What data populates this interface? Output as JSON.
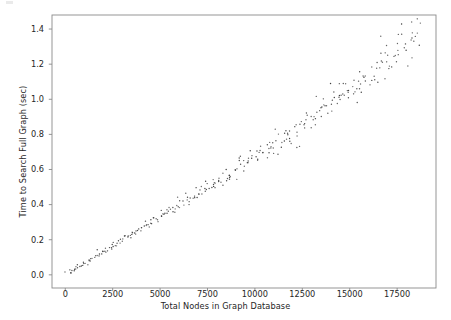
{
  "figure": {
    "background": "#ffffff",
    "axes_frame_color": "#8a8a8a",
    "tick_color": "#8a8a8a",
    "marker_color": "#3a3a3a"
  },
  "chart_data": {
    "type": "scatter",
    "title": "",
    "xlabel": "Total Nodes in Graph Database",
    "ylabel": "Time to Search Full Graph (sec)",
    "xlim": [
      -700,
      19550
    ],
    "ylim": [
      -0.075,
      1.48
    ],
    "xticks": [
      0,
      2500,
      5000,
      7500,
      10000,
      12500,
      15000,
      17500
    ],
    "xtick_labels": [
      "0",
      "2500",
      "5000",
      "7500",
      "10000",
      "12500",
      "15000",
      "17500"
    ],
    "yticks": [
      0.0,
      0.2,
      0.4,
      0.6,
      0.8,
      1.0,
      1.2,
      1.4
    ],
    "ytick_labels": [
      "0.0",
      "0.2",
      "0.4",
      "0.6",
      "0.8",
      "1.0",
      "1.2",
      "1.4"
    ],
    "grid": false,
    "legend": null,
    "marker": "point",
    "marker_size_px": 1.4,
    "n_points": 600,
    "relationship": "near-linear, slightly super-linear growth of search time with node count; scatter band widens as node count increases",
    "approx_slope_sec_per_node": 6.55e-05,
    "x_range_observed": [
      60,
      18700
    ],
    "y_range_observed": [
      0.004,
      1.37
    ],
    "points": [
      [
        120,
        0.006
      ],
      [
        180,
        0.012
      ],
      [
        240,
        0.015
      ],
      [
        300,
        0.018
      ],
      [
        360,
        0.022
      ],
      [
        420,
        0.027
      ],
      [
        480,
        0.03
      ],
      [
        540,
        0.034
      ],
      [
        600,
        0.038
      ],
      [
        660,
        0.043
      ],
      [
        720,
        0.046
      ],
      [
        780,
        0.05
      ],
      [
        840,
        0.055
      ],
      [
        900,
        0.058
      ],
      [
        960,
        0.062
      ],
      [
        1020,
        0.066
      ],
      [
        1080,
        0.071
      ],
      [
        1140,
        0.074
      ],
      [
        1200,
        0.079
      ],
      [
        1260,
        0.082
      ],
      [
        1320,
        0.087
      ],
      [
        1380,
        0.09
      ],
      [
        1440,
        0.095
      ],
      [
        1500,
        0.098
      ],
      [
        1560,
        0.102
      ],
      [
        1620,
        0.107
      ],
      [
        1680,
        0.11
      ],
      [
        1740,
        0.115
      ],
      [
        1800,
        0.118
      ],
      [
        1860,
        0.122
      ],
      [
        1920,
        0.127
      ],
      [
        1980,
        0.13
      ],
      [
        2040,
        0.134
      ],
      [
        2100,
        0.139
      ],
      [
        2160,
        0.142
      ],
      [
        2220,
        0.146
      ],
      [
        2280,
        0.151
      ],
      [
        2340,
        0.154
      ],
      [
        2400,
        0.158
      ],
      [
        2460,
        0.163
      ],
      [
        2520,
        0.166
      ],
      [
        2580,
        0.17
      ],
      [
        2640,
        0.175
      ],
      [
        2700,
        0.178
      ],
      [
        2760,
        0.183
      ],
      [
        2820,
        0.186
      ],
      [
        2880,
        0.19
      ],
      [
        2940,
        0.195
      ],
      [
        3000,
        0.198
      ],
      [
        3060,
        0.202
      ],
      [
        3120,
        0.207
      ],
      [
        3180,
        0.21
      ],
      [
        3240,
        0.214
      ],
      [
        3300,
        0.219
      ],
      [
        3360,
        0.222
      ],
      [
        3420,
        0.226
      ],
      [
        3480,
        0.231
      ],
      [
        3540,
        0.234
      ],
      [
        3600,
        0.238
      ],
      [
        3660,
        0.243
      ],
      [
        3720,
        0.246
      ],
      [
        3780,
        0.251
      ],
      [
        3840,
        0.254
      ],
      [
        3900,
        0.258
      ],
      [
        3960,
        0.263
      ],
      [
        4020,
        0.266
      ],
      [
        4080,
        0.27
      ],
      [
        4140,
        0.275
      ],
      [
        4200,
        0.278
      ],
      [
        4260,
        0.283
      ],
      [
        4320,
        0.286
      ],
      [
        4380,
        0.29
      ],
      [
        4440,
        0.295
      ],
      [
        4500,
        0.298
      ],
      [
        4560,
        0.302
      ],
      [
        4620,
        0.307
      ],
      [
        4680,
        0.31
      ],
      [
        4740,
        0.315
      ],
      [
        4800,
        0.318
      ],
      [
        4860,
        0.323
      ],
      [
        4920,
        0.326
      ],
      [
        4980,
        0.33
      ],
      [
        5040,
        0.335
      ],
      [
        5100,
        0.338
      ],
      [
        5160,
        0.343
      ],
      [
        5220,
        0.346
      ],
      [
        5280,
        0.35
      ],
      [
        5340,
        0.355
      ],
      [
        5400,
        0.358
      ],
      [
        5460,
        0.363
      ],
      [
        5520,
        0.366
      ],
      [
        5580,
        0.371
      ],
      [
        5640,
        0.374
      ],
      [
        5700,
        0.378
      ],
      [
        5760,
        0.383
      ],
      [
        5820,
        0.386
      ],
      [
        5880,
        0.391
      ],
      [
        5940,
        0.394
      ],
      [
        6000,
        0.399
      ],
      [
        6060,
        0.402
      ],
      [
        6120,
        0.407
      ],
      [
        6180,
        0.41
      ],
      [
        6240,
        0.415
      ],
      [
        6300,
        0.418
      ],
      [
        6360,
        0.423
      ],
      [
        6420,
        0.426
      ],
      [
        6480,
        0.431
      ],
      [
        6540,
        0.434
      ],
      [
        6600,
        0.439
      ],
      [
        6660,
        0.442
      ],
      [
        6720,
        0.447
      ],
      [
        6780,
        0.45
      ],
      [
        6840,
        0.455
      ],
      [
        6900,
        0.458
      ],
      [
        6960,
        0.463
      ],
      [
        7020,
        0.466
      ],
      [
        7080,
        0.471
      ],
      [
        7140,
        0.474
      ],
      [
        7200,
        0.479
      ],
      [
        7260,
        0.482
      ],
      [
        7320,
        0.487
      ],
      [
        7380,
        0.49
      ],
      [
        7440,
        0.495
      ],
      [
        7500,
        0.498
      ],
      [
        7560,
        0.503
      ],
      [
        7620,
        0.506
      ],
      [
        7680,
        0.511
      ],
      [
        7740,
        0.515
      ],
      [
        7800,
        0.519
      ],
      [
        7860,
        0.523
      ],
      [
        7920,
        0.527
      ],
      [
        7980,
        0.531
      ],
      [
        8040,
        0.535
      ],
      [
        8100,
        0.539
      ],
      [
        8160,
        0.543
      ],
      [
        8220,
        0.547
      ],
      [
        8280,
        0.551
      ],
      [
        8340,
        0.555
      ],
      [
        8400,
        0.559
      ],
      [
        8460,
        0.563
      ],
      [
        8520,
        0.567
      ],
      [
        8580,
        0.571
      ],
      [
        8640,
        0.575
      ],
      [
        8700,
        0.579
      ],
      [
        8760,
        0.583
      ],
      [
        8820,
        0.588
      ],
      [
        8880,
        0.592
      ],
      [
        8940,
        0.596
      ],
      [
        9000,
        0.6
      ],
      [
        9060,
        0.604
      ],
      [
        9120,
        0.608
      ],
      [
        9180,
        0.612
      ],
      [
        9240,
        0.616
      ],
      [
        9300,
        0.62
      ],
      [
        9360,
        0.625
      ],
      [
        9420,
        0.629
      ],
      [
        9480,
        0.633
      ],
      [
        9540,
        0.637
      ],
      [
        9600,
        0.641
      ],
      [
        9660,
        0.645
      ],
      [
        9720,
        0.65
      ],
      [
        9780,
        0.654
      ],
      [
        9840,
        0.658
      ],
      [
        9900,
        0.662
      ],
      [
        9960,
        0.666
      ],
      [
        10020,
        0.671
      ],
      [
        10080,
        0.675
      ],
      [
        10140,
        0.679
      ],
      [
        10200,
        0.683
      ],
      [
        10260,
        0.688
      ],
      [
        10320,
        0.692
      ],
      [
        10380,
        0.696
      ],
      [
        10440,
        0.7
      ],
      [
        10500,
        0.705
      ],
      [
        10560,
        0.709
      ],
      [
        10620,
        0.713
      ],
      [
        10680,
        0.718
      ],
      [
        10740,
        0.722
      ],
      [
        10800,
        0.726
      ],
      [
        10860,
        0.731
      ],
      [
        10920,
        0.735
      ],
      [
        10980,
        0.739
      ],
      [
        11040,
        0.744
      ],
      [
        11100,
        0.748
      ],
      [
        11160,
        0.752
      ],
      [
        11220,
        0.757
      ],
      [
        11280,
        0.761
      ],
      [
        11340,
        0.766
      ],
      [
        11400,
        0.77
      ],
      [
        11460,
        0.774
      ],
      [
        11520,
        0.779
      ],
      [
        11580,
        0.783
      ],
      [
        11640,
        0.788
      ],
      [
        11700,
        0.792
      ],
      [
        11760,
        0.797
      ],
      [
        11820,
        0.801
      ],
      [
        11880,
        0.806
      ],
      [
        11940,
        0.81
      ],
      [
        12000,
        0.815
      ],
      [
        12060,
        0.819
      ],
      [
        12120,
        0.824
      ],
      [
        12180,
        0.828
      ],
      [
        12240,
        0.833
      ],
      [
        12300,
        0.837
      ],
      [
        12360,
        0.842
      ],
      [
        12420,
        0.846
      ],
      [
        12480,
        0.851
      ],
      [
        12540,
        0.855
      ],
      [
        12600,
        0.86
      ],
      [
        12660,
        0.865
      ],
      [
        12720,
        0.869
      ],
      [
        12780,
        0.874
      ],
      [
        12840,
        0.878
      ],
      [
        12900,
        0.883
      ],
      [
        12960,
        0.888
      ],
      [
        13020,
        0.892
      ],
      [
        13080,
        0.897
      ],
      [
        13140,
        0.902
      ],
      [
        13200,
        0.906
      ],
      [
        13260,
        0.911
      ],
      [
        13320,
        0.916
      ],
      [
        13380,
        0.92
      ],
      [
        13440,
        0.925
      ],
      [
        13500,
        0.93
      ],
      [
        13560,
        0.934
      ],
      [
        13620,
        0.939
      ],
      [
        13680,
        0.944
      ],
      [
        13740,
        0.949
      ],
      [
        13800,
        0.953
      ],
      [
        13860,
        0.958
      ],
      [
        13920,
        0.963
      ],
      [
        13980,
        0.968
      ],
      [
        14040,
        0.972
      ],
      [
        14100,
        0.977
      ],
      [
        14160,
        0.982
      ],
      [
        14220,
        0.987
      ],
      [
        14280,
        0.992
      ],
      [
        14340,
        0.996
      ],
      [
        14400,
        1.001
      ],
      [
        14460,
        1.006
      ],
      [
        14520,
        1.011
      ],
      [
        14580,
        1.016
      ],
      [
        14640,
        1.021
      ],
      [
        14700,
        1.026
      ],
      [
        14760,
        1.03
      ],
      [
        14820,
        1.035
      ],
      [
        14880,
        1.04
      ],
      [
        14940,
        1.045
      ],
      [
        15000,
        1.05
      ],
      [
        15060,
        1.055
      ],
      [
        15120,
        1.06
      ],
      [
        15180,
        1.065
      ],
      [
        15240,
        1.07
      ],
      [
        15300,
        1.075
      ],
      [
        15360,
        1.08
      ],
      [
        15420,
        1.085
      ],
      [
        15480,
        1.09
      ],
      [
        15540,
        1.095
      ],
      [
        15600,
        1.1
      ],
      [
        15660,
        1.105
      ],
      [
        15720,
        1.11
      ],
      [
        15780,
        1.115
      ],
      [
        15840,
        1.12
      ],
      [
        15900,
        1.125
      ],
      [
        15960,
        1.13
      ],
      [
        16020,
        1.135
      ],
      [
        16080,
        1.14
      ],
      [
        16140,
        1.145
      ],
      [
        16200,
        1.151
      ],
      [
        16260,
        1.156
      ],
      [
        16320,
        1.161
      ],
      [
        16380,
        1.166
      ],
      [
        16440,
        1.171
      ],
      [
        16500,
        1.176
      ],
      [
        16560,
        1.182
      ],
      [
        16620,
        1.187
      ],
      [
        16680,
        1.192
      ],
      [
        16740,
        1.197
      ],
      [
        16800,
        1.203
      ],
      [
        16860,
        1.208
      ],
      [
        16920,
        1.213
      ],
      [
        16980,
        1.218
      ],
      [
        17040,
        1.224
      ],
      [
        17100,
        1.229
      ],
      [
        17160,
        1.234
      ],
      [
        17220,
        1.24
      ],
      [
        17280,
        1.245
      ],
      [
        17340,
        1.25
      ],
      [
        17400,
        1.256
      ],
      [
        17460,
        1.261
      ],
      [
        17520,
        1.267
      ],
      [
        17580,
        1.272
      ],
      [
        17640,
        1.277
      ],
      [
        17700,
        1.283
      ],
      [
        17760,
        1.288
      ],
      [
        17820,
        1.294
      ],
      [
        17880,
        1.299
      ],
      [
        17940,
        1.305
      ],
      [
        18000,
        1.31
      ],
      [
        18060,
        1.316
      ],
      [
        18120,
        1.321
      ],
      [
        18180,
        1.327
      ],
      [
        18240,
        1.332
      ],
      [
        18300,
        1.338
      ],
      [
        18360,
        1.344
      ],
      [
        18420,
        1.349
      ],
      [
        18480,
        1.355
      ],
      [
        18540,
        1.361
      ],
      [
        18600,
        1.366
      ],
      [
        18660,
        1.372
      ]
    ]
  }
}
